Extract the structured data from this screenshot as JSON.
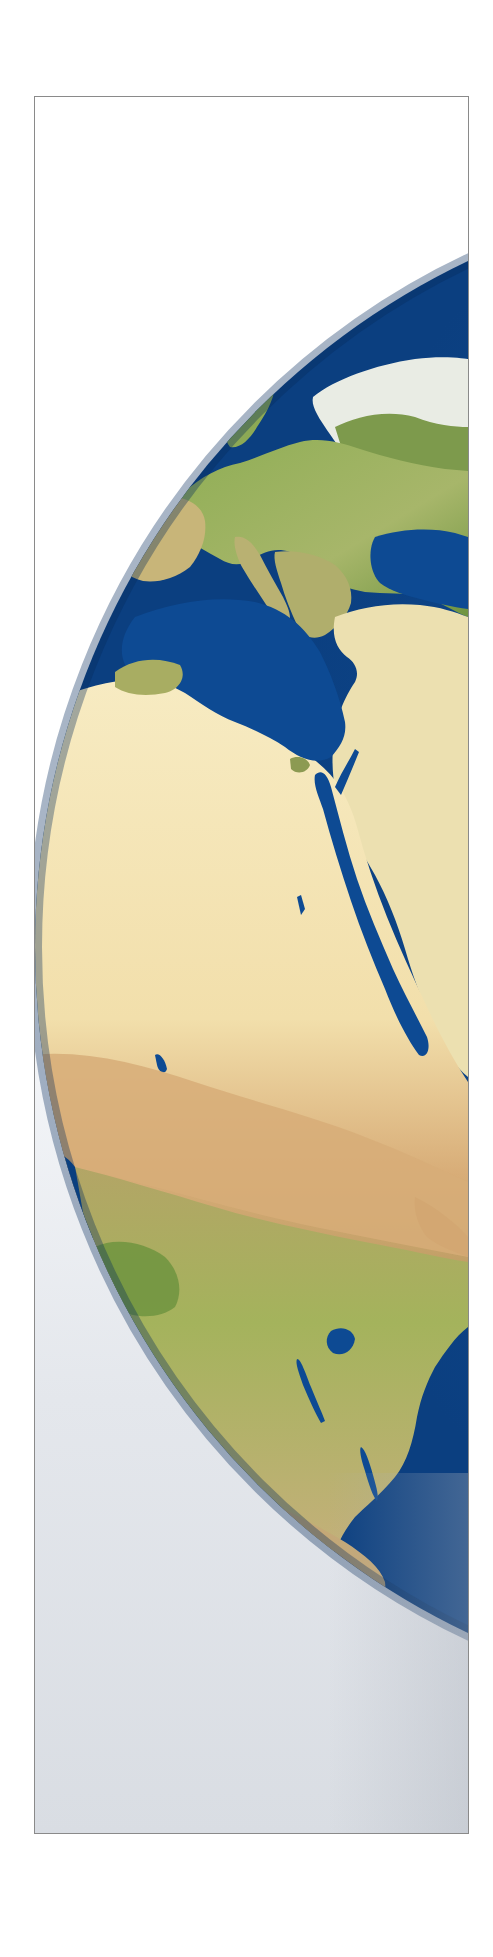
{
  "image": {
    "subject": "earth-globe",
    "view": "Europe and Africa, left half of globe visible, clipped at right frame edge",
    "colors": {
      "ocean": "#0d4a93",
      "ocean_deep": "#0a3f82",
      "desert": "#f4e6b4",
      "desert_tan": "#d9b27a",
      "vegetation": "#9bb15a",
      "forest": "#6f9440",
      "ice": "#f5f7f6",
      "frame_border": "#8a8a8a",
      "background_bottom": "#d9dde3"
    }
  }
}
